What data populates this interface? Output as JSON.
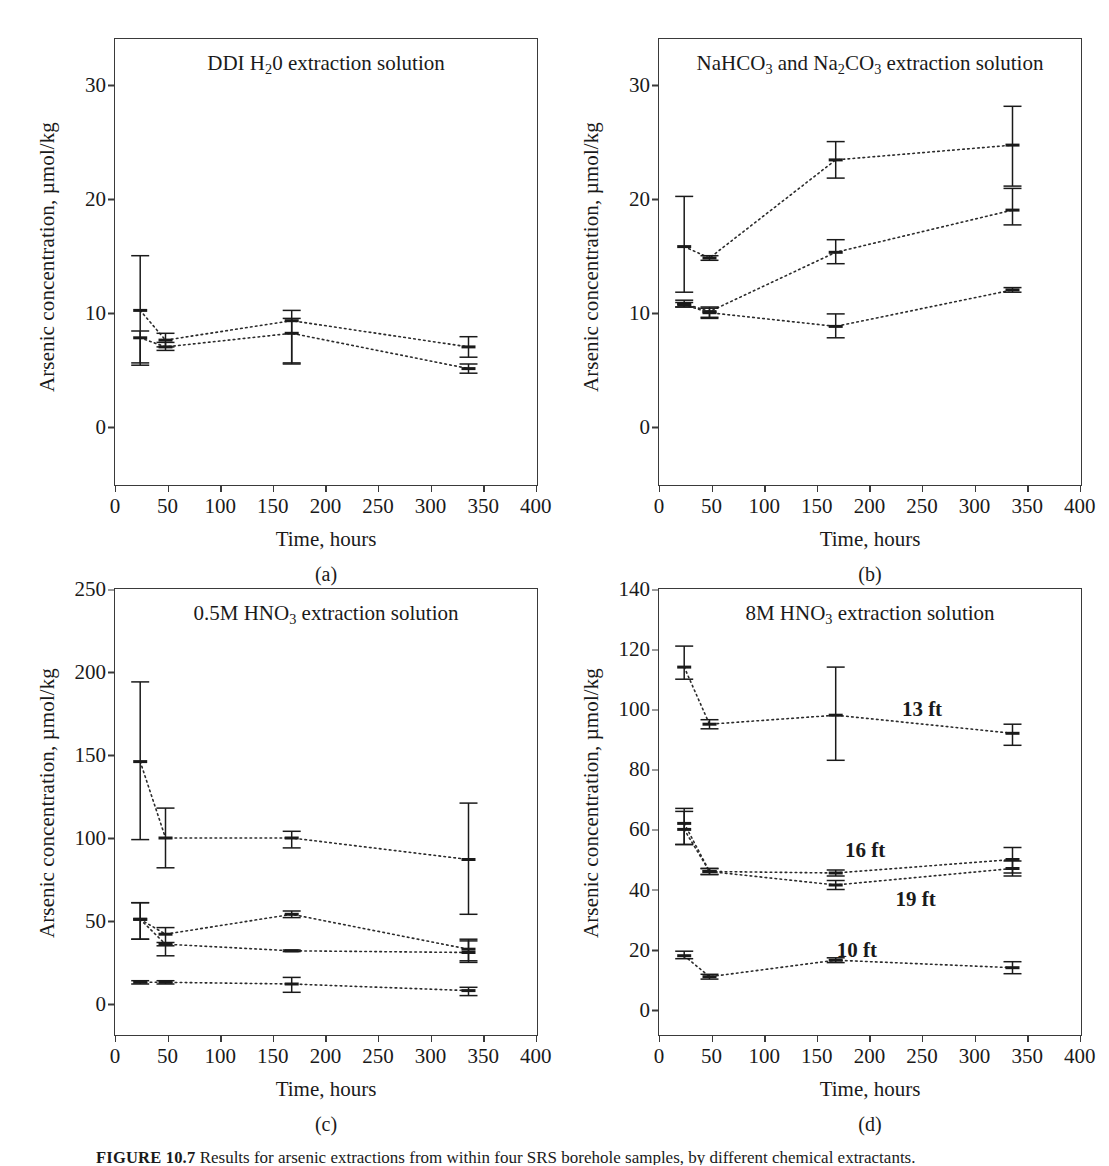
{
  "figure": {
    "caption_label": "FIGURE 10.7",
    "caption_text": "Results for arsenic extractions from within four SRS borehole samples, by different chemical extractants.",
    "panels": [
      "a",
      "b",
      "c",
      "d"
    ]
  },
  "axes": {
    "xlabel": "Time, hours",
    "ylabel": "Arsenic concentration, µmol/kg",
    "xticks": [
      0,
      50,
      100,
      150,
      200,
      250,
      300,
      350,
      400
    ],
    "xlim": [
      0,
      400
    ]
  },
  "chart_data": [
    {
      "type": "line",
      "panel": "a",
      "title": "DDI H₂0 extraction solution",
      "title_parts": {
        "pre": "DDI H",
        "sub": "2",
        "post": "0 extraction solution"
      },
      "xlabel": "Time, hours",
      "ylabel": "Arsenic concentration, µmol/kg",
      "xlim": [
        0,
        400
      ],
      "ylim": [
        -5,
        34
      ],
      "yticks": [
        0,
        10,
        20,
        30
      ],
      "grid": false,
      "legend_position": "none",
      "linestyle": "dotted",
      "x": [
        24,
        48,
        168,
        336
      ],
      "series": [
        {
          "name": "upper",
          "values": [
            10.2,
            7.6,
            9.3,
            7.0
          ],
          "err_low": [
            4.8,
            0.6,
            3.7,
            0.9
          ],
          "err_high": [
            4.8,
            0.6,
            0.9,
            0.9
          ]
        },
        {
          "name": "lower",
          "values": [
            7.8,
            7.0,
            8.2,
            5.1
          ],
          "err_low": [
            2.2,
            0.3,
            2.7,
            0.4
          ],
          "err_high": [
            0.6,
            0.4,
            1.3,
            0.4
          ]
        }
      ]
    },
    {
      "type": "line",
      "panel": "b",
      "title": "NaHCO₃ and Na₂CO₃ extraction solution",
      "title_parts": {
        "pre": "NaHCO",
        "sub": "3",
        "mid": " and Na",
        "sub2": "2",
        "mid2": "CO",
        "sub3": "3",
        "post": " extraction solution"
      },
      "xlabel": "Time, hours",
      "ylabel": "Arsenic concentration, µmol/kg",
      "xlim": [
        0,
        400
      ],
      "ylim": [
        -5,
        34
      ],
      "yticks": [
        0,
        10,
        20,
        30
      ],
      "grid": false,
      "legend_position": "none",
      "linestyle": "dotted",
      "x": [
        24,
        48,
        168,
        336
      ],
      "series": [
        {
          "name": "top",
          "values": [
            15.8,
            14.8,
            23.4,
            24.7
          ],
          "err_low": [
            4.0,
            0.2,
            1.6,
            3.6
          ],
          "err_high": [
            4.4,
            0.2,
            1.6,
            3.4
          ]
        },
        {
          "name": "middle",
          "values": [
            10.8,
            10.1,
            15.3,
            19.0
          ],
          "err_low": [
            0.3,
            0.5,
            1.0,
            1.3
          ],
          "err_high": [
            0.3,
            0.4,
            1.1,
            1.9
          ]
        },
        {
          "name": "bottom",
          "values": [
            10.7,
            10.0,
            8.8,
            12.0
          ],
          "err_low": [
            0.2,
            0.5,
            1.0,
            0.2
          ],
          "err_high": [
            0.2,
            0.4,
            1.1,
            0.2
          ]
        }
      ]
    },
    {
      "type": "line",
      "panel": "c",
      "title": "0.5M HNO₃ extraction solution",
      "title_parts": {
        "pre": "0.5M HNO",
        "sub": "3",
        "post": " extraction solution"
      },
      "xlabel": "Time, hours",
      "ylabel": "Arsenic concentration, µmol/kg",
      "xlim": [
        0,
        400
      ],
      "ylim": [
        -18,
        250
      ],
      "yticks": [
        0,
        50,
        100,
        150,
        200,
        250
      ],
      "grid": false,
      "legend_position": "none",
      "linestyle": "dotted",
      "x": [
        24,
        48,
        168,
        336
      ],
      "series": [
        {
          "name": "top",
          "values": [
            146,
            100,
            100,
            87
          ],
          "err_low": [
            47,
            18,
            6,
            33
          ],
          "err_high": [
            48,
            18,
            4,
            34
          ]
        },
        {
          "name": "second",
          "values": [
            51,
            42,
            54,
            33
          ],
          "err_low": [
            12,
            13,
            2,
            7
          ],
          "err_high": [
            10,
            4,
            2,
            6
          ]
        },
        {
          "name": "third",
          "values": [
            51,
            36,
            32,
            31
          ],
          "err_low": [
            12,
            1,
            0.5,
            6
          ],
          "err_high": [
            10,
            1,
            0.5,
            7
          ]
        },
        {
          "name": "bottom",
          "values": [
            13,
            13,
            12,
            8
          ],
          "err_low": [
            1,
            1,
            5,
            3
          ],
          "err_high": [
            1,
            1,
            4,
            2
          ]
        }
      ]
    },
    {
      "type": "line",
      "panel": "d",
      "title": "8M HNO₃ extraction solution",
      "title_parts": {
        "pre": "8M HNO",
        "sub": "3",
        "post": " extraction solution"
      },
      "xlabel": "Time, hours",
      "ylabel": "Arsenic concentration, µmol/kg",
      "xlim": [
        0,
        400
      ],
      "ylim": [
        -8,
        140
      ],
      "yticks": [
        0,
        20,
        40,
        60,
        80,
        100,
        120,
        140
      ],
      "grid": false,
      "legend_position": "inline-annotations",
      "linestyle": "dotted",
      "x": [
        24,
        48,
        168,
        336
      ],
      "series": [
        {
          "name": "13 ft",
          "label": "13 ft",
          "values": [
            114,
            95,
            98,
            92
          ],
          "err_low": [
            4,
            1.5,
            15,
            4
          ],
          "err_high": [
            7,
            1.5,
            16,
            3
          ]
        },
        {
          "name": "16 ft",
          "label": "16 ft",
          "values": [
            62,
            46,
            45.5,
            50
          ],
          "err_low": [
            7,
            1,
            1,
            4.5
          ],
          "err_high": [
            5,
            1,
            1,
            4
          ]
        },
        {
          "name": "19 ft",
          "label": "19 ft",
          "values": [
            60,
            46,
            41.5,
            47
          ],
          "err_low": [
            5,
            1,
            1.5,
            2.5
          ],
          "err_high": [
            6,
            1,
            1.5,
            2.5
          ]
        },
        {
          "name": "10 ft",
          "label": "10 ft",
          "values": [
            18,
            11,
            16.5,
            14
          ],
          "err_low": [
            1,
            0.8,
            0.8,
            2
          ],
          "err_high": [
            1.5,
            0.8,
            0.8,
            2
          ]
        }
      ],
      "annotations": [
        {
          "text": "13 ft",
          "x": 250,
          "y": 100
        },
        {
          "text": "16 ft",
          "x": 196,
          "y": 53
        },
        {
          "text": "19 ft",
          "x": 244,
          "y": 37
        },
        {
          "text": "10 ft",
          "x": 188,
          "y": 20
        }
      ]
    }
  ]
}
